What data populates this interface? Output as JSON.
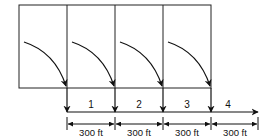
{
  "diagram": {
    "segments": [
      {
        "number": "1",
        "distance": "300 ft"
      },
      {
        "number": "2",
        "distance": "300 ft"
      },
      {
        "number": "3",
        "distance": "300 ft"
      },
      {
        "number": "4",
        "distance": "300 ft"
      }
    ],
    "colors": {
      "stroke": "#111111",
      "background": "#ffffff"
    }
  }
}
